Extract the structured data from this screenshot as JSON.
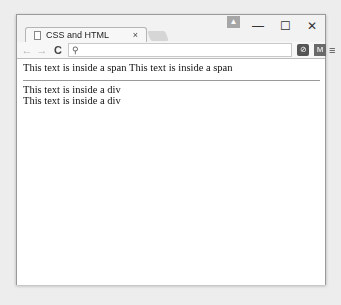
{
  "window": {
    "tab_title": "CSS and HTML",
    "tab_close_glyph": "×",
    "profile_glyph": "▲",
    "minimize_glyph": "—",
    "maximize_glyph": "☐",
    "close_glyph": "✕"
  },
  "toolbar": {
    "back_glyph": "←",
    "forward_glyph": "→",
    "reload_glyph": "C",
    "search_glyph": "⚲",
    "address_value": "",
    "extension1_glyph": "⊘",
    "extension2_glyph": "M",
    "menu_glyph": "≡"
  },
  "content": {
    "spans": [
      "This text is inside a span",
      "This text is inside a span"
    ],
    "divs": [
      "This text is inside a div",
      "This text is inside a div"
    ]
  },
  "colors": {
    "window_border": "#9a9a9a",
    "toolbar_bg": "#f7f7f7",
    "page_bg": "#ffffff",
    "text": "#111111"
  }
}
